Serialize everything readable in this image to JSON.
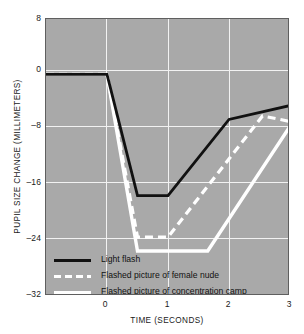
{
  "chart_data": {
    "type": "line",
    "title": "",
    "xlabel": "TIME (SECONDS)",
    "ylabel": "PUPIL SIZE CHANGE (MILLIMETERS)",
    "xlim": [
      -1,
      3
    ],
    "ylim": [
      -32,
      8
    ],
    "xticks": [
      0,
      1,
      2,
      3
    ],
    "xtick_labels": [
      "0",
      "1",
      "2",
      "3"
    ],
    "yticks": [
      8,
      0,
      -8,
      -16,
      -24,
      -32
    ],
    "ytick_labels": [
      "8",
      "0",
      "–8",
      "–16",
      "–24",
      "–32"
    ],
    "grid": true,
    "legend_position": "inside-bottom-left",
    "plot_background": "#a9a9a9",
    "gridline_color": "#f2f2f2",
    "series": [
      {
        "name": "Light flash",
        "style": "solid",
        "color": "#111111",
        "x": [
          -1,
          0,
          0.5,
          1,
          2,
          3
        ],
        "y": [
          0,
          0,
          -17.5,
          -17.5,
          -6.5,
          -4.5
        ]
      },
      {
        "name": "Flashed picture of female nude",
        "style": "dashed",
        "color": "#ffffff",
        "x": [
          -1,
          0,
          0.5,
          1,
          2.55,
          3
        ],
        "y": [
          0,
          0,
          -23.5,
          -23.5,
          -6.0,
          -6.8
        ]
      },
      {
        "name": "Flashed picture of concentration camp",
        "style": "solid",
        "color": "#ffffff",
        "x": [
          -1,
          0,
          0.5,
          1.65,
          3
        ],
        "y": [
          0,
          0,
          -25.5,
          -25.5,
          -7.5
        ]
      }
    ]
  },
  "legend": {
    "items": [
      {
        "label": "Light flash",
        "swatch": "solid-black"
      },
      {
        "label": "Flashed picture of female nude",
        "swatch": "dashed-white"
      },
      {
        "label": "Flashed picture of concentration camp",
        "swatch": "solid-white"
      }
    ]
  },
  "axes": {
    "y": {
      "label": "PUPIL SIZE CHANGE (MILLIMETERS)",
      "ticks": [
        "8",
        "0",
        "–8",
        "–16",
        "–24",
        "–32"
      ]
    },
    "x": {
      "label": "TIME (SECONDS)",
      "ticks": [
        "0",
        "1",
        "2",
        "3"
      ]
    }
  }
}
